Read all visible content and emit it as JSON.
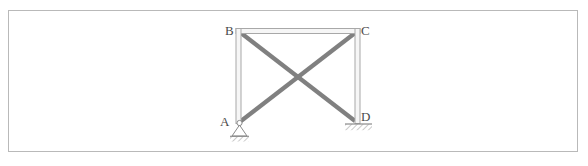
{
  "figure": {
    "border_color": "#b9b9b9",
    "background_color": "#ffffff"
  },
  "labels": {
    "A": "A",
    "B": "B",
    "C": "C",
    "D": "D"
  },
  "geometry": {
    "units": "pixels",
    "nodes": {
      "A": {
        "x": 239,
        "y": 123
      },
      "B": {
        "x": 239,
        "y": 31
      },
      "C": {
        "x": 357,
        "y": 31
      },
      "D": {
        "x": 357,
        "y": 123
      }
    },
    "frame_members": [
      {
        "name": "column-AB",
        "from": "A",
        "to": "B",
        "style": "hollow-double-line"
      },
      {
        "name": "beam-BC",
        "from": "B",
        "to": "C",
        "style": "hollow-double-line"
      },
      {
        "name": "column-CD",
        "from": "C",
        "to": "D",
        "style": "hollow-double-line"
      }
    ],
    "braces": [
      {
        "name": "diagonal-BD",
        "from": "B",
        "to": "D",
        "style": "solid-thick"
      },
      {
        "name": "diagonal-AC",
        "from": "A",
        "to": "C",
        "style": "solid-thick"
      }
    ],
    "supports": [
      {
        "name": "support-A",
        "at": "A",
        "type": "pin",
        "symbol": "triangle-with-hatched-ground"
      },
      {
        "name": "support-D",
        "at": "D",
        "type": "fixed",
        "symbol": "hatched-ground-line"
      }
    ]
  },
  "colors": {
    "frame_member": "#a8a8a8",
    "frame_member_inner": "#f2f2f2",
    "brace": "#808080",
    "support": "#8a8a8a",
    "hatch": "#8a8a8a",
    "label_text": "#4a4a4a",
    "border": "#b9b9b9"
  }
}
